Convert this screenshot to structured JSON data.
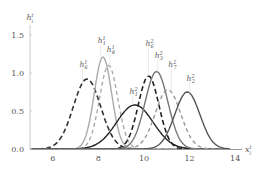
{
  "chart_data": {
    "type": "line",
    "title": "",
    "xlabel": "x_i^t",
    "ylabel": "h_i^t",
    "xlim": [
      5,
      14.3
    ],
    "ylim": [
      0,
      1.65
    ],
    "xticks": [
      6,
      8,
      10,
      12,
      14
    ],
    "yticks": [
      0.0,
      0.5,
      1.0,
      1.5
    ],
    "ytick_labels": [
      "0.0",
      "0.5",
      "1.0",
      "1.5"
    ],
    "grid": false,
    "legend": "inline labels with leader lines",
    "series": [
      {
        "name": "h_6^1",
        "label": "h",
        "sub": "6",
        "sup": "1",
        "mu": 7.5,
        "sigma": 0.6,
        "peak": 0.92,
        "color": "#333333",
        "dash": "5,3",
        "width": 1.6,
        "label_x": 7.3,
        "label_y": 1.08
      },
      {
        "name": "h_1^1",
        "label": "h",
        "sub": "1",
        "sup": "1",
        "mu": 8.2,
        "sigma": 0.38,
        "peak": 1.21,
        "color": "#aaaaaa",
        "dash": "",
        "width": 1.4,
        "label_x": 8.1,
        "label_y": 1.4
      },
      {
        "name": "h_8^1",
        "label": "h",
        "sub": "8",
        "sup": "1",
        "mu": 8.45,
        "sigma": 0.4,
        "peak": 1.1,
        "color": "#aaaaaa",
        "dash": "4,3",
        "width": 1.4,
        "label_x": 8.5,
        "label_y": 1.28
      },
      {
        "name": "h_1^2",
        "label": "h",
        "sub": "1",
        "sup": "2",
        "mu": 9.6,
        "sigma": 0.8,
        "peak": 0.58,
        "color": "#222222",
        "dash": "",
        "width": 1.4,
        "label_x": 9.5,
        "label_y": 0.72
      },
      {
        "name": "h_6^2",
        "label": "h",
        "sub": "6",
        "sup": "2",
        "mu": 10.2,
        "sigma": 0.45,
        "peak": 0.96,
        "color": "#222222",
        "dash": "5,3",
        "width": 1.6,
        "label_x": 10.2,
        "label_y": 1.35
      },
      {
        "name": "h_3^2",
        "label": "h",
        "sub": "3",
        "sup": "2",
        "mu": 10.55,
        "sigma": 0.5,
        "peak": 1.02,
        "color": "#777777",
        "dash": "",
        "width": 1.4,
        "label_x": 10.6,
        "label_y": 1.2
      },
      {
        "name": "h_7^2",
        "label": "h",
        "sub": "7",
        "sup": "2",
        "mu": 11.05,
        "sigma": 0.55,
        "peak": 0.78,
        "color": "#999999",
        "dash": "4,3",
        "width": 1.4,
        "label_x": 11.2,
        "label_y": 1.08
      },
      {
        "name": "h_2^2",
        "label": "h",
        "sub": "2",
        "sup": "2",
        "mu": 11.9,
        "sigma": 0.55,
        "peak": 0.75,
        "color": "#555555",
        "dash": "",
        "width": 1.4,
        "label_x": 12.0,
        "label_y": 0.9
      }
    ]
  },
  "plot": {
    "origin_px": [
      30,
      149
    ],
    "x_px_per_unit": 22.8,
    "y_px_per_unit": 76
  }
}
